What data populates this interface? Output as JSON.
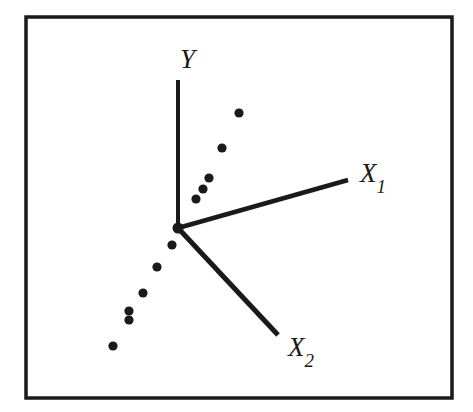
{
  "figure": {
    "title": "",
    "background_color": "#ffffff",
    "ink_color": "#1a1a1a",
    "frame": {
      "x": 26,
      "y": 17,
      "width": 426,
      "height": 381,
      "stroke_width": 3.5
    }
  },
  "axes": {
    "origin": {
      "x": 178,
      "y": 228,
      "dot_radius": 5.5
    },
    "items": [
      {
        "name": "Y",
        "label": "Y",
        "subscript": "",
        "x1": 178,
        "y1": 80,
        "x2": 178,
        "y2": 228,
        "stroke_width": 4,
        "label_x": 180,
        "label_y": 68,
        "label_size": 27
      },
      {
        "name": "X1",
        "label": "X",
        "subscript": "1",
        "x1": 178,
        "y1": 228,
        "x2": 348,
        "y2": 180,
        "stroke_width": 4.5,
        "label_x": 360,
        "label_y": 182,
        "label_size": 27
      },
      {
        "name": "X2",
        "label": "X",
        "subscript": "2",
        "x1": 178,
        "y1": 228,
        "x2": 278,
        "y2": 335,
        "stroke_width": 5,
        "label_x": 288,
        "label_y": 356,
        "label_size": 27
      }
    ]
  },
  "chart_data": {
    "type": "scatter",
    "title": "",
    "xlabel": "",
    "ylabel": "",
    "grid": false,
    "legend": null,
    "axis_style": "oblique three-axis (Y vertical, X1 upper-right, X2 lower-right)",
    "point_radius": 4.6,
    "point_color": "#1a1a1a",
    "xlim": [
      26,
      452
    ],
    "ylim": [
      398,
      17
    ],
    "points": [
      {
        "x": 239,
        "y": 113
      },
      {
        "x": 222,
        "y": 148
      },
      {
        "x": 209,
        "y": 178
      },
      {
        "x": 203,
        "y": 189
      },
      {
        "x": 196,
        "y": 199
      },
      {
        "x": 172,
        "y": 245
      },
      {
        "x": 157,
        "y": 267
      },
      {
        "x": 143,
        "y": 293
      },
      {
        "x": 129,
        "y": 311
      },
      {
        "x": 129,
        "y": 320
      },
      {
        "x": 113,
        "y": 346
      }
    ],
    "point_count": 11
  }
}
